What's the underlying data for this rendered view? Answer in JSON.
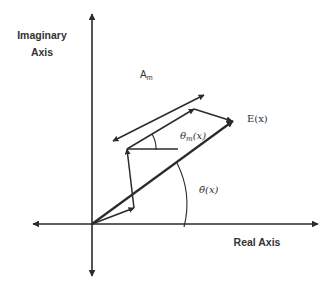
{
  "diagram": {
    "colors": {
      "line": "#2b2b2b",
      "text": "#333333",
      "background": "#ffffff"
    },
    "axes": {
      "imaginary_label_line1": "Imaginary",
      "imaginary_label_line2": "Axis",
      "real_label": "Real Axis"
    },
    "labels": {
      "amplitude": "A",
      "amplitude_sub": "m",
      "resultant": "E(x)",
      "theta_m_base": "θ",
      "theta_m_sub": "m",
      "theta_m_arg": "(x)",
      "theta_bar": "θ̄(x)"
    }
  }
}
